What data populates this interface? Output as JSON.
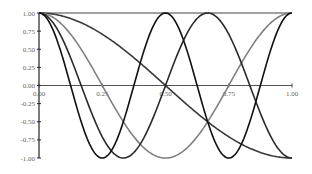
{
  "chart_data": {
    "type": "line",
    "title": "",
    "xlabel": "",
    "ylabel": "",
    "xlim": [
      0,
      1
    ],
    "ylim": [
      -1,
      1
    ],
    "grid": false,
    "legend": "none",
    "x_ticks": [
      "0.00",
      "0.25",
      "0.50",
      "0.75",
      "1.00"
    ],
    "y_ticks": [
      "1.00",
      "0.75",
      "0.50",
      "0.25",
      "0.00",
      "-0.25",
      "-0.50",
      "-0.75",
      "-1.00"
    ],
    "series": [
      {
        "name": "cos(pi x)",
        "n": 1,
        "color": "#3a3a3a"
      },
      {
        "name": "cos(2 pi x)",
        "n": 2,
        "color": "#808080"
      },
      {
        "name": "cos(3 pi x)",
        "n": 3,
        "color": "#2a2a2a"
      },
      {
        "name": "cos(4 pi x)",
        "n": 4,
        "color": "#111111"
      }
    ],
    "x": [
      0,
      0.125,
      0.25,
      0.375,
      0.5,
      0.625,
      0.75,
      0.875,
      1
    ],
    "series_values": {
      "cos(pi x)": [
        1,
        0.92,
        0.71,
        0.38,
        0,
        -0.38,
        -0.71,
        -0.92,
        -1
      ],
      "cos(2 pi x)": [
        1,
        0.71,
        0,
        -0.71,
        -1,
        -0.71,
        0,
        0.71,
        1
      ],
      "cos(3 pi x)": [
        1,
        0.38,
        -0.71,
        -0.92,
        0,
        0.92,
        0.71,
        -0.38,
        -1
      ],
      "cos(4 pi x)": [
        1,
        0,
        -1,
        0,
        1,
        0,
        -1,
        0,
        1
      ]
    }
  }
}
